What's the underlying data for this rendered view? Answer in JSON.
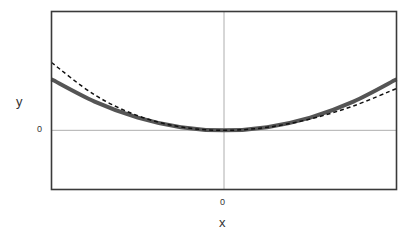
{
  "chart_data": {
    "type": "line",
    "title": "",
    "xlabel": "x",
    "ylabel": "y",
    "x_ticks": [
      "0"
    ],
    "y_ticks": [
      "0"
    ],
    "xlim": [
      -1,
      1
    ],
    "ylim": [
      -1.16,
      2.33
    ],
    "grid": "zero lines only",
    "legend": "none",
    "series": [
      {
        "name": "exact",
        "style": "solid",
        "color": "#555555",
        "width": 4,
        "x": [
          -1,
          -0.75,
          -0.5,
          -0.25,
          0,
          0.25,
          0.5,
          0.75,
          1
        ],
        "y": [
          1.0,
          0.5625,
          0.25,
          0.0625,
          0,
          0.0625,
          0.25,
          0.5625,
          1.0
        ]
      },
      {
        "name": "approximation",
        "style": "dashed",
        "color": "#111111",
        "width": 1.5,
        "x": [
          -1,
          -0.75,
          -0.5,
          -0.25,
          0,
          0.25,
          0.5,
          0.75,
          1
        ],
        "y": [
          1.33,
          0.695,
          0.287,
          0.066,
          0,
          0.059,
          0.223,
          0.478,
          0.82
        ]
      }
    ]
  },
  "axes": {
    "x_title": "x",
    "y_title": "y",
    "x_zero_label": "0",
    "y_zero_label": "0"
  }
}
